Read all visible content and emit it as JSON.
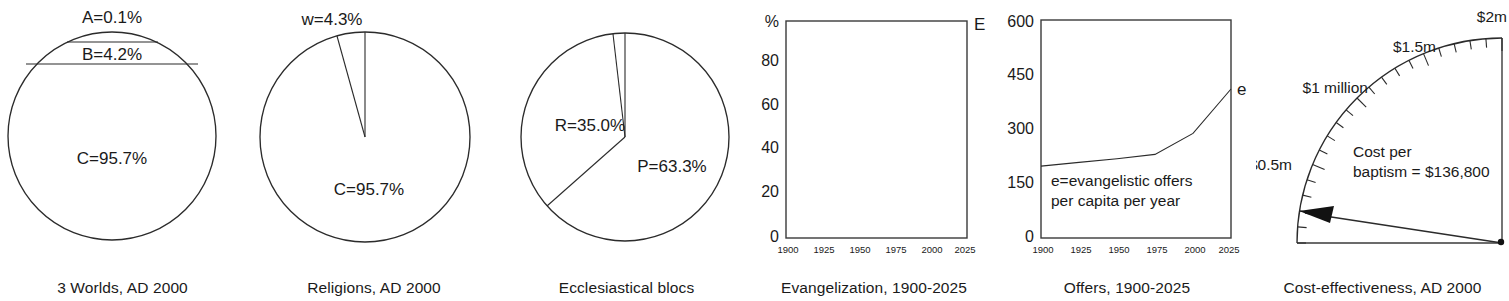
{
  "figure": {
    "background": "#ffffff",
    "ink_color": "#1a1a1a",
    "panel_count": 6
  },
  "panels": [
    {
      "id": "three-worlds",
      "caption": "3 Worlds, AD 2000",
      "kind": "banded-circle",
      "labels": {
        "a": "A=0.1%",
        "b": "B=4.2%",
        "c": "C=95.7%"
      }
    },
    {
      "id": "religions",
      "caption": "Religions, AD 2000",
      "kind": "pie",
      "labels": {
        "w": "w=4.3%",
        "c": "C=95.7%"
      }
    },
    {
      "id": "ecclesiastical-blocs",
      "caption": "Ecclesiastical blocs",
      "kind": "pie",
      "labels": {
        "r": "R=35.0%",
        "p": "P=63.3%"
      }
    },
    {
      "id": "evangelization",
      "caption": "Evangelization, 1900-2025",
      "kind": "line",
      "labels": {
        "yunit": "%",
        "series": "E"
      }
    },
    {
      "id": "offers",
      "caption": "Offers, 1900-2025",
      "kind": "line",
      "labels": {
        "series": "e",
        "note_line1": "e=evangelistic offers",
        "note_line2": "per capita per year"
      }
    },
    {
      "id": "cost-effectiveness",
      "caption": "Cost-effectiveness, AD 2000",
      "kind": "gauge",
      "labels": {
        "t0": "$0.5m",
        "t1": "$1 million",
        "t2": "$1.5m",
        "t3": "$2m",
        "note_line1": "Cost per",
        "note_line2": "baptism = $136,800"
      }
    }
  ],
  "chart_data": [
    {
      "type": "pie",
      "id": "three-worlds",
      "title": "3 Worlds, AD 2000",
      "rendering": "circle divided by horizontal chords",
      "categories": [
        "A",
        "B",
        "C"
      ],
      "values": [
        0.1,
        4.2,
        95.7
      ],
      "labels": [
        "A=0.1%",
        "B=4.2%",
        "C=95.7%"
      ],
      "unit": "percent",
      "legend": "none"
    },
    {
      "type": "pie",
      "id": "religions",
      "title": "Religions, AD 2000",
      "categories": [
        "w",
        "C"
      ],
      "values": [
        4.3,
        95.7
      ],
      "labels": [
        "w=4.3%",
        "C=95.7%"
      ],
      "unit": "percent",
      "start_angle_deg": 90,
      "direction": "counterclockwise",
      "legend": "none"
    },
    {
      "type": "pie",
      "id": "ecclesiastical-blocs",
      "title": "Ecclesiastical blocs",
      "categories": [
        "P",
        "R",
        "other"
      ],
      "values": [
        63.3,
        35.0,
        1.7
      ],
      "labels": [
        "P=63.3%",
        "R=35.0%",
        ""
      ],
      "unit": "percent",
      "start_angle_deg": 90,
      "direction": "clockwise",
      "legend": "none"
    },
    {
      "type": "line",
      "id": "evangelization",
      "title": "Evangelization, 1900-2025",
      "xlabel": "",
      "ylabel": "%",
      "xlim": [
        1900,
        2025
      ],
      "ylim": [
        0,
        100
      ],
      "xticks": [
        1900,
        1925,
        1950,
        1975,
        2000,
        2025
      ],
      "yticks": [
        0,
        20,
        40,
        60,
        80
      ],
      "grid": false,
      "legend": "inline-right",
      "series": [
        {
          "name": "E",
          "x": [],
          "values": [],
          "note": "curve not rendered in this reproduction; frame only"
        }
      ]
    },
    {
      "type": "line",
      "id": "offers",
      "title": "Offers, 1900-2025",
      "xlabel": "",
      "ylabel": "",
      "xlim": [
        1900,
        2025
      ],
      "ylim": [
        0,
        600
      ],
      "xticks": [
        1900,
        1925,
        1950,
        1975,
        2000,
        2025
      ],
      "yticks": [
        0,
        150,
        300,
        450,
        600
      ],
      "grid": false,
      "legend": "inline-right",
      "annotation": "e=evangelistic offers per capita per year",
      "series": [
        {
          "name": "e",
          "x": [
            1900,
            1925,
            1950,
            1975,
            2000,
            2025
          ],
          "values": [
            198,
            208,
            218,
            230,
            288,
            410
          ]
        }
      ]
    },
    {
      "type": "gauge",
      "id": "cost-effectiveness",
      "title": "Cost-effectiveness, AD 2000",
      "scale_min": 0,
      "scale_max": 2000000,
      "scale_labels": [
        "$0.5m",
        "$1 million",
        "$1.5m",
        "$2m"
      ],
      "scale_label_values": [
        500000,
        1000000,
        1500000,
        2000000
      ],
      "major_tick_count": 4,
      "minor_tick_count": 20,
      "value": 136800,
      "value_label": "$136,800",
      "annotation": "Cost per baptism = $136,800"
    }
  ]
}
